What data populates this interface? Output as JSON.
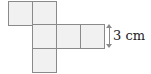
{
  "diagram": {
    "type": "cube-net",
    "squares": [
      {
        "id": "top-left",
        "x": 8,
        "y": 1
      },
      {
        "id": "top-middle",
        "x": 32,
        "y": 1
      },
      {
        "id": "middle-1",
        "x": 32,
        "y": 24
      },
      {
        "id": "middle-2",
        "x": 56,
        "y": 24
      },
      {
        "id": "middle-3",
        "x": 80,
        "y": 24
      },
      {
        "id": "bottom",
        "x": 32,
        "y": 48
      }
    ],
    "dimension_label": "3 cm",
    "colors": {
      "fill": "#f1f1f1",
      "stroke": "#8a8a8a",
      "text": "#222222"
    }
  }
}
